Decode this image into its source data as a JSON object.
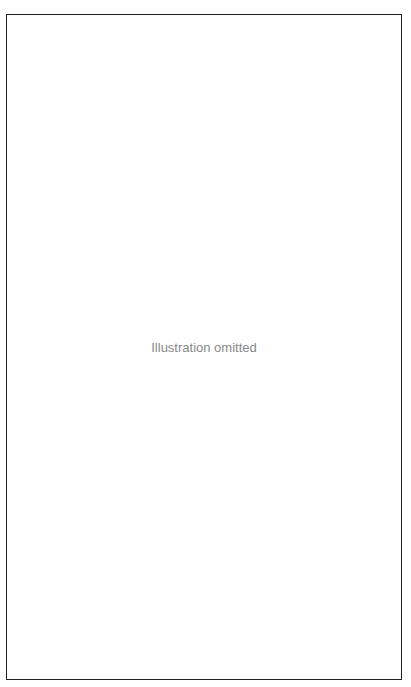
{
  "frame": {
    "border_color": "#222222",
    "background": "#ffffff",
    "placeholder_text": "Illustration omitted"
  }
}
